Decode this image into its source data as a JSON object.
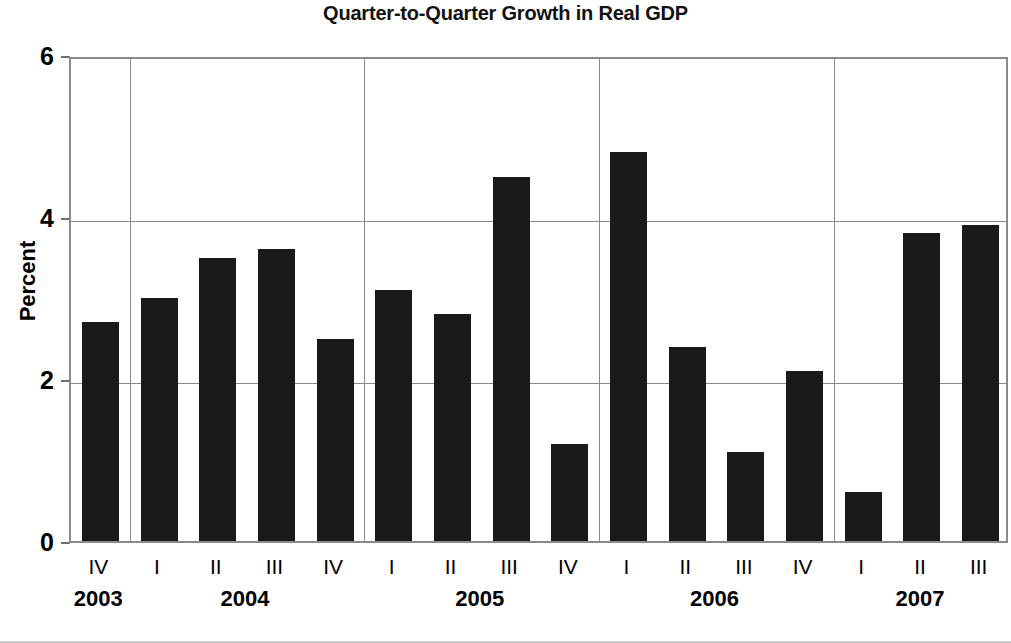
{
  "chart_data": {
    "type": "bar",
    "title": "Quarter-to-Quarter Growth in Real GDP",
    "xlabel": "",
    "ylabel": "Percent",
    "ylim": [
      0,
      6
    ],
    "yticks": [
      0,
      2,
      4,
      6
    ],
    "ytick_labels": [
      "0",
      "2",
      "4",
      "6"
    ],
    "grid": true,
    "legend": "none",
    "bar_color": "#1a1a1a",
    "axis_color": "#8a8a8a",
    "categories": [
      "2003 IV",
      "2004 I",
      "2004 II",
      "2004 III",
      "2004 IV",
      "2005 I",
      "2005 II",
      "2005 III",
      "2005 IV",
      "2006 I",
      "2006 II",
      "2006 III",
      "2006 IV",
      "2007 I",
      "2007 II",
      "2007 III"
    ],
    "quarter_labels": [
      "IV",
      "I",
      "II",
      "III",
      "IV",
      "I",
      "II",
      "III",
      "IV",
      "I",
      "II",
      "III",
      "IV",
      "I",
      "II",
      "III"
    ],
    "values": [
      2.7,
      3.0,
      3.5,
      3.6,
      2.5,
      3.1,
      2.8,
      4.5,
      1.2,
      4.8,
      2.4,
      1.1,
      2.1,
      0.6,
      3.8,
      3.9
    ],
    "year_groups": [
      {
        "year": "2003",
        "start_index": 0,
        "count": 1
      },
      {
        "year": "2004",
        "start_index": 1,
        "count": 4
      },
      {
        "year": "2005",
        "start_index": 5,
        "count": 4
      },
      {
        "year": "2006",
        "start_index": 9,
        "count": 4
      },
      {
        "year": "2007",
        "start_index": 13,
        "count": 3
      }
    ]
  }
}
